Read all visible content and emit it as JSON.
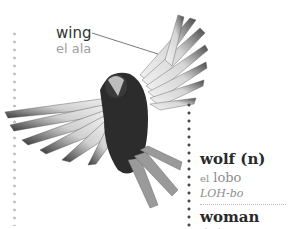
{
  "annotation": {
    "term_en": "wing",
    "term_es": "el ala"
  },
  "entries": [
    {
      "word": "wolf (n)",
      "article": "el",
      "translation": "lobo",
      "pronunciation": "LOH-bo"
    },
    {
      "word": "woman (n)"
    }
  ],
  "image": {
    "subject": "bird-in-flight"
  },
  "colors": {
    "text_dark": "#2a2a2a",
    "text_muted": "#8d8d8d",
    "dots_left": "#c4c4c4",
    "dots_right": "#4a4a4a"
  }
}
